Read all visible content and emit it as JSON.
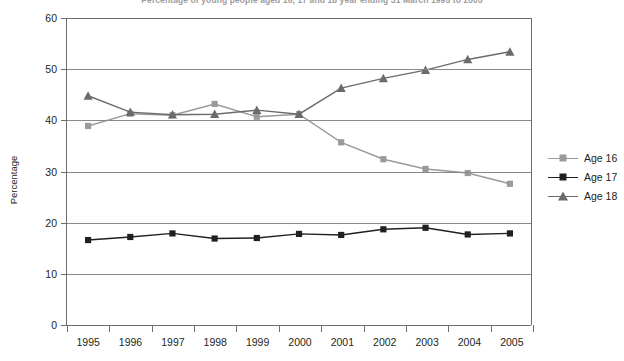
{
  "chart": {
    "title": "Percentage of young people aged 16, 17 and 18 year ending 31 March 1995 to 2005",
    "ylabel": "Percentage"
  },
  "legend": {
    "position": "right",
    "items": [
      {
        "label": "Age 16",
        "color": "#9a9a9a",
        "marker": "square"
      },
      {
        "label": "Age 17",
        "color": "#231f20",
        "marker": "square"
      },
      {
        "label": "Age 18",
        "color": "#6b6b6b",
        "marker": "triangle"
      }
    ]
  },
  "axis": {
    "yticks": [
      "0",
      "10",
      "20",
      "30",
      "40",
      "50",
      "60"
    ],
    "xticks": [
      "1995",
      "1996",
      "1997",
      "1998",
      "1999",
      "2000",
      "2001",
      "2002",
      "2003",
      "2004",
      "2005"
    ]
  },
  "chart_data": {
    "type": "line",
    "title": "Percentage of young people aged 16, 17 and 18 year ending 31 March 1995 to 2005",
    "xlabel": "",
    "ylabel": "Percentage",
    "ylim": [
      0,
      60
    ],
    "ytick_step": 10,
    "grid": true,
    "legend_position": "right",
    "categories": [
      "1995",
      "1996",
      "1997",
      "1998",
      "1999",
      "2000",
      "2001",
      "2002",
      "2003",
      "2004",
      "2005"
    ],
    "series": [
      {
        "name": "Age 16",
        "marker": "square",
        "color": "#9a9a9a",
        "values": [
          38.9,
          41.3,
          41.0,
          43.2,
          40.7,
          41.2,
          35.7,
          32.4,
          30.5,
          29.7,
          27.6
        ]
      },
      {
        "name": "Age 17",
        "marker": "square",
        "color": "#231f20",
        "values": [
          16.6,
          17.2,
          17.9,
          16.9,
          17.0,
          17.8,
          17.6,
          18.7,
          19.0,
          17.7,
          17.9
        ]
      },
      {
        "name": "Age 18",
        "marker": "triangle",
        "color": "#6b6b6b",
        "values": [
          44.8,
          41.6,
          41.1,
          41.2,
          42.0,
          41.2,
          46.3,
          48.2,
          49.8,
          51.9,
          53.4
        ]
      }
    ]
  }
}
